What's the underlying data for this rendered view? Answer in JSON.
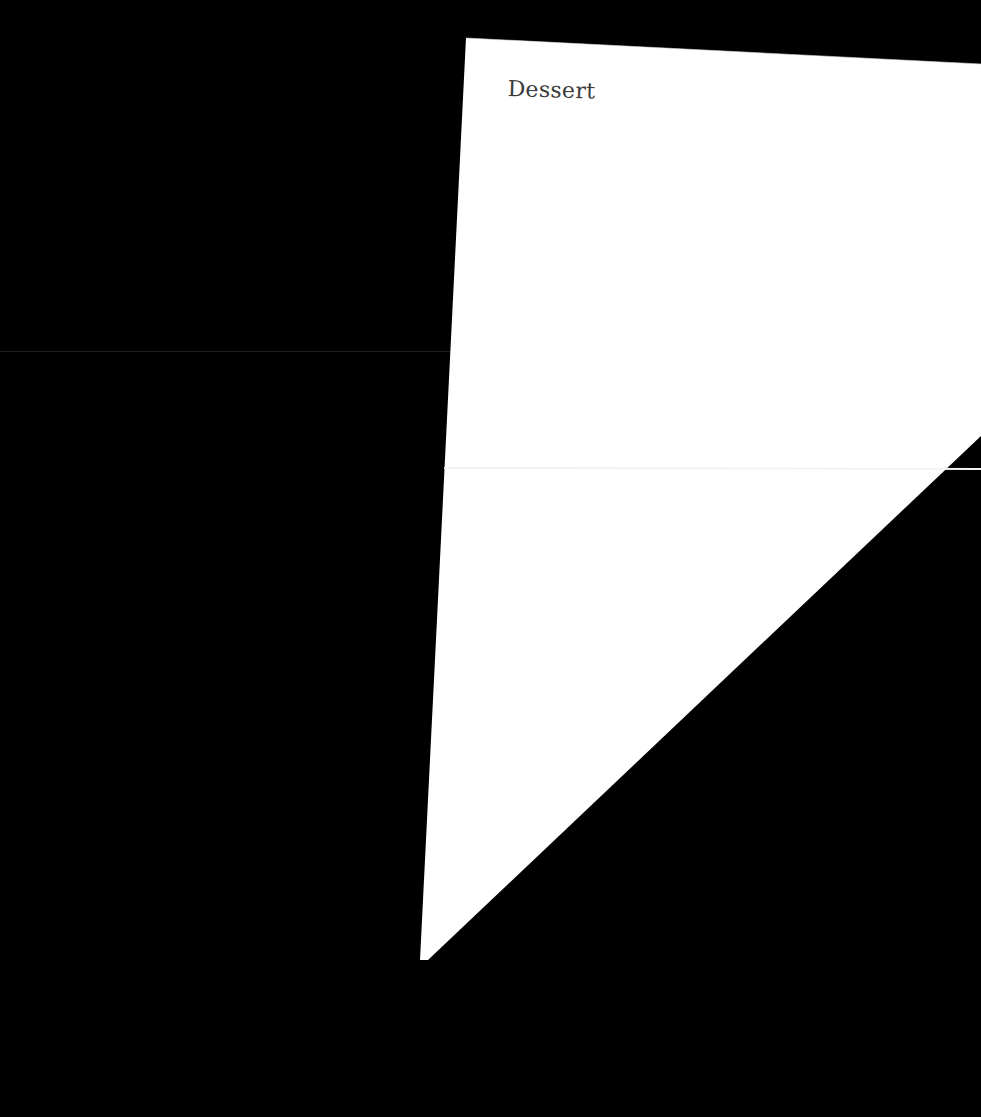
{
  "document": {
    "title": "Dessert"
  },
  "colors": {
    "background": "#000000",
    "paper": "#ffffff",
    "text": "#3a3a3a",
    "fold_line": "#f0f0f0"
  }
}
